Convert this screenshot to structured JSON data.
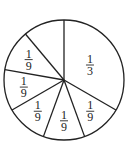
{
  "chart_data": {
    "type": "pie",
    "title": "",
    "slices": [
      {
        "label": "1/3",
        "value": 0.3333,
        "numerator": "1",
        "denominator": "3",
        "labeled": true
      },
      {
        "label": "1/9",
        "value": 0.1111,
        "numerator": "1",
        "denominator": "9",
        "labeled": true
      },
      {
        "label": "1/9",
        "value": 0.1111,
        "numerator": "1",
        "denominator": "9",
        "labeled": true
      },
      {
        "label": "1/9",
        "value": 0.1111,
        "numerator": "1",
        "denominator": "9",
        "labeled": true
      },
      {
        "label": "1/9",
        "value": 0.1111,
        "numerator": "1",
        "denominator": "9",
        "labeled": true
      },
      {
        "label": "1/9",
        "value": 0.1111,
        "numerator": "1",
        "denominator": "9",
        "labeled": true
      },
      {
        "label": "",
        "value": 0.1111,
        "numerator": "",
        "denominator": "",
        "labeled": false
      }
    ],
    "start_angle": "12 o'clock",
    "direction": "clockwise",
    "legend": "none",
    "colors": {
      "stroke": "#222222",
      "fill": "#ffffff"
    }
  }
}
